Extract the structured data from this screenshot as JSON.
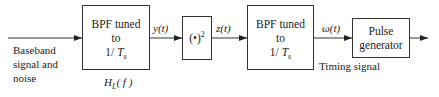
{
  "input": {
    "label_lines": [
      "Baseband",
      "signal and",
      "noise"
    ]
  },
  "blocks": [
    {
      "id": "bpf1",
      "lines": [
        "BPF tuned",
        "to",
        "1/ T_s"
      ],
      "sub_label": "H_L( f )"
    },
    {
      "id": "squarer",
      "label": "(•)",
      "exponent": "2"
    },
    {
      "id": "bpf2",
      "lines": [
        "BPF tuned",
        "to",
        "1/ T_s"
      ]
    },
    {
      "id": "pulse_gen",
      "lines": [
        "Pulse",
        "generator"
      ]
    }
  ],
  "signals": {
    "y": "y(t)",
    "z": "z(t)",
    "w": "ω(t)",
    "timing": "Timing signal"
  },
  "text": {
    "bpf1_l1": "BPF tuned",
    "bpf1_l2": "to",
    "bpf1_l3_pre": "1/ ",
    "bpf1_l3_var": "T",
    "bpf1_l3_sub": "s",
    "hl_var": "H",
    "hl_sub": "L",
    "hl_arg": "( f )",
    "sq_base": "(•)",
    "sq_exp": "2",
    "bpf2_l1": "BPF tuned",
    "bpf2_l2": "to",
    "bpf2_l3_pre": "1/ ",
    "bpf2_l3_var": "T",
    "bpf2_l3_sub": "s",
    "pg_l1": "Pulse",
    "pg_l2": "generator"
  }
}
